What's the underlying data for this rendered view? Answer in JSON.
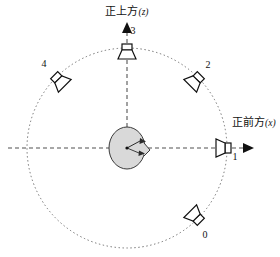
{
  "figure": {
    "type": "speaker-array-diagram",
    "view": "vertical-plane (x-z) circular loudspeaker array around listener head",
    "background_color": "#ffffff",
    "line_color": "#111111",
    "dash_color": "#7a7a7a",
    "head_fill": "#d9d9d9"
  },
  "axes": {
    "vertical": {
      "label_main": "正上方",
      "label_paren": "(z)",
      "label_full": "正上方(z)",
      "direction": "up",
      "style": "dashed-with-arrowhead"
    },
    "horizontal": {
      "label_main": "正前方",
      "label_paren": "(x)",
      "label_full": "正前方(x)",
      "direction": "right",
      "style": "dashed-with-arrowhead"
    }
  },
  "circle": {
    "center_x": 127,
    "center_y": 148,
    "radius": 100,
    "stroke": "dotted"
  },
  "listener": {
    "name": "head",
    "center_x": 127,
    "center_y": 148,
    "radius_x": 18,
    "radius_y": 21,
    "facing": "right",
    "fill": "#d9d9d9"
  },
  "speakers": [
    {
      "id": "0",
      "label": "0",
      "angle_deg": -45,
      "cx": 198,
      "cy": 219,
      "rotation": -45,
      "label_x": 205,
      "label_y": 238
    },
    {
      "id": "1",
      "label": "1",
      "angle_deg": 0,
      "cx": 227,
      "cy": 148,
      "rotation": 0,
      "label_x": 235,
      "label_y": 160
    },
    {
      "id": "2",
      "label": "2",
      "angle_deg": 45,
      "cx": 198,
      "cy": 78,
      "rotation": 45,
      "label_x": 208,
      "label_y": 68
    },
    {
      "id": "3",
      "label": "3",
      "angle_deg": 90,
      "cx": 127,
      "cy": 48,
      "rotation": 90,
      "label_x": 133,
      "label_y": 34
    },
    {
      "id": "4",
      "label": "4",
      "angle_deg": 135,
      "cx": 57,
      "cy": 78,
      "rotation": 135,
      "label_x": 44,
      "label_y": 67
    }
  ]
}
